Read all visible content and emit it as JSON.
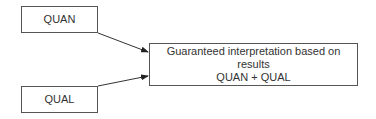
{
  "diagram": {
    "nodes": [
      {
        "id": "quan",
        "label": "QUAN"
      },
      {
        "id": "qual",
        "label": "QUAL"
      },
      {
        "id": "result",
        "line1": "Guaranteed interpretation based on results",
        "line2": "QUAN + QUAL"
      }
    ],
    "edges": [
      {
        "from": "quan",
        "to": "result"
      },
      {
        "from": "qual",
        "to": "result"
      }
    ],
    "colors": {
      "stroke": "#555555",
      "text": "#333333",
      "background": "#ffffff"
    }
  }
}
